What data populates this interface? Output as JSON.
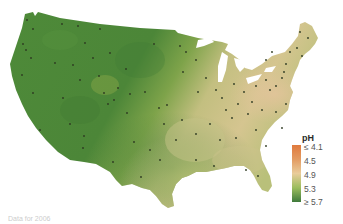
{
  "legend": {
    "title": "pH",
    "labels": [
      "≤ 4.1",
      "4.5",
      "4.9",
      "5.3",
      "≥ 5.7"
    ],
    "colors": [
      "#e07a3e",
      "#e39b62",
      "#e9cc9a",
      "#9bbd5e",
      "#3f7a3c"
    ]
  },
  "map": {
    "subject": "Precipitation pH across the contiguous United States",
    "region": "United States (contiguous 48 states)",
    "base_color_west": "#4f8a3a",
    "base_color_east": "#c9c48a",
    "lowest_ph_region": "Ohio Valley / Pennsylvania / New York",
    "lakes_color": "#ffffff",
    "station_dot_color": "#2e3a22"
  },
  "caption": {
    "text": "Data for 2006"
  }
}
